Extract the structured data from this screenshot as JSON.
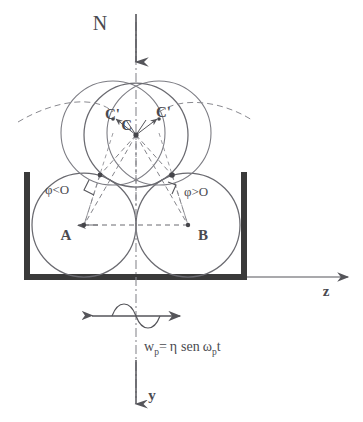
{
  "figure": {
    "background_color": "#ffffff",
    "ink_color": "#55555a",
    "wall_color": "#3a3a3a"
  },
  "axes": {
    "vertical_down_label": "y",
    "horizontal_right_label": "z",
    "top_axis_label": "N",
    "vertical_axis_style": "dash-dot",
    "horizontal_axis_style": "solid-arrow"
  },
  "labels": {
    "center_top": "C",
    "center_left_prime": "C'",
    "center_right_prime": "C'",
    "sphere_left": "A",
    "sphere_right": "B",
    "angle_left": "φ<O",
    "angle_right": "φ>O"
  },
  "formula": {
    "lhs_base": "w",
    "lhs_sub": "p",
    "equals": "=",
    "eta": "η",
    "function": "sen",
    "omega": "ω",
    "omega_sub": "p",
    "time": "t",
    "full_text": "w_p = η sen ω_p t"
  },
  "geometry": {
    "sphere_radius": 52,
    "sphere_A": {
      "cx": 84,
      "cy": 225
    },
    "sphere_B": {
      "cx": 188,
      "cy": 225
    },
    "sphere_C": {
      "cx": 136,
      "cy": 135
    },
    "sphere_C_left": {
      "cx": 113,
      "cy": 133
    },
    "sphere_C_right": {
      "cx": 159,
      "cy": 133
    },
    "contact_left": {
      "x": 100,
      "y": 175
    },
    "contact_right": {
      "x": 172,
      "y": 175
    },
    "container_left_x": 24,
    "container_right_x": 247,
    "container_top_y": 172,
    "container_bottom_y": 277,
    "axis_vertical_x": 136,
    "axis_horizontal_y": 277
  },
  "annotations": {
    "oscillation_marker": "double-headed-arrow-with-sine-wave",
    "precession_arc": "dashed-arc-through-C-primes",
    "right_angle_marks": 2
  }
}
